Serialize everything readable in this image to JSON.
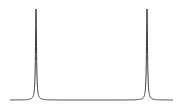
{
  "chart_data": {
    "type": "line",
    "title": "",
    "xlabel": "",
    "ylabel": "",
    "grid": false,
    "legend": null,
    "x_pixel_range": [
      10,
      173
    ],
    "baseline_y_pixel": 100,
    "top_y_pixel": 9,
    "series": [
      {
        "name": "spectrum",
        "color": "#3a3a3a",
        "peaks": [
          {
            "x_px": 36,
            "height": 1.0
          },
          {
            "x_px": 147,
            "height": 1.0
          }
        ],
        "lineshape": "lorentzian",
        "width_px": 0.6
      }
    ]
  }
}
